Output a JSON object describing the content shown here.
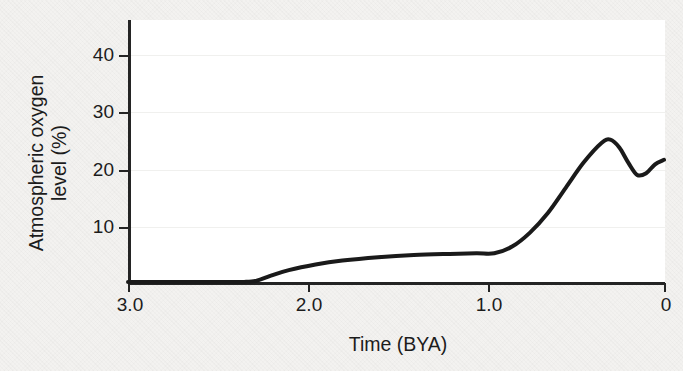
{
  "figure": {
    "background_color": "#f3f2f0",
    "plot_background_color": "#ffffff",
    "axis_color": "#242424",
    "curve_color": "#1a1a1a"
  },
  "chart_data": {
    "type": "line",
    "title": "",
    "subtitle": "",
    "xlabel": "Time (BYA)",
    "ylabel": "Atmospheric oxygen level (%)",
    "ylabel_line1": "Atmospheric oxygen",
    "ylabel_line2": "level (%)",
    "xlim": [
      3.0,
      0
    ],
    "ylim": [
      0,
      46
    ],
    "x_inverted": true,
    "grid": true,
    "grid_axis": "y",
    "legend": "none",
    "xticks": [
      3.0,
      2.0,
      1.0,
      0
    ],
    "xtick_labels": [
      "3.0",
      "2.0",
      "1.0",
      "0"
    ],
    "yticks": [
      10,
      20,
      30,
      40
    ],
    "ytick_labels": [
      "10",
      "20",
      "30",
      "40"
    ],
    "series": [
      {
        "name": "Atmospheric oxygen level",
        "x": [
          3.0,
          2.6,
          2.35,
          2.28,
          2.2,
          2.1,
          1.95,
          1.8,
          1.6,
          1.4,
          1.2,
          1.05,
          0.95,
          0.85,
          0.75,
          0.65,
          0.55,
          0.45,
          0.35,
          0.3,
          0.25,
          0.2,
          0.15,
          0.1,
          0.05,
          0.0
        ],
        "y": [
          0.2,
          0.2,
          0.2,
          0.4,
          1.3,
          2.3,
          3.3,
          4.0,
          4.6,
          5.0,
          5.2,
          5.3,
          5.3,
          6.5,
          9.0,
          12.5,
          17.0,
          21.5,
          25.0,
          25.6,
          24.2,
          21.5,
          19.3,
          19.6,
          21.2,
          22.0
        ]
      }
    ],
    "annotations": []
  }
}
